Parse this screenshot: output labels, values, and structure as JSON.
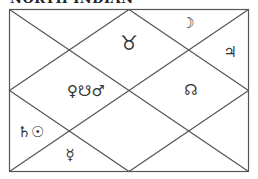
{
  "title": "NORTH INDIAN",
  "chart": {
    "line_color": "#555555",
    "houses": [
      {
        "house": 1,
        "sign_symbol": "♉",
        "planets": ""
      },
      {
        "house": 2,
        "planets": "☽"
      },
      {
        "house": 3,
        "planets": "♃"
      },
      {
        "house": 4,
        "planets": "♀☋♂"
      },
      {
        "house": 10,
        "planets": "☊"
      },
      {
        "house": 6,
        "planets": "♄☉"
      },
      {
        "house": 7,
        "planets": "☿"
      }
    ]
  }
}
